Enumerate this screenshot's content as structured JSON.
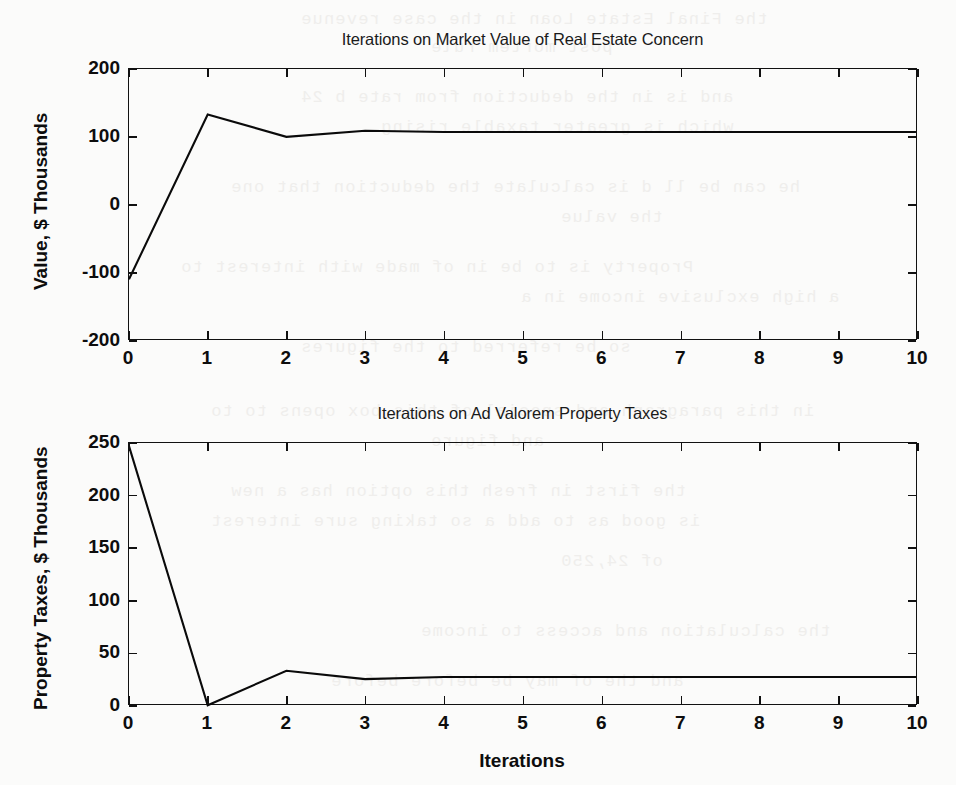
{
  "page": {
    "background_color": "#fbfbfa",
    "ink_color": "#0d0d0d",
    "ghost_text": [
      "the Final Estate Loan in the case revenue",
      "post mortem rule",
      "and is in the deduction from rate b 24",
      "which is greater taxable rising",
      "he  can  be  ll d is  calculate  the  deduction  that one",
      "the value",
      "Property is to be in of made with interest to",
      "a high  exclusive  income  in  a",
      "so be referred to the figures",
      "in this paragraph and special of this box opens to to",
      "and figure",
      "the first in fresh this option has a new",
      "is good as to add a so taking sure interest",
      "of 24,250",
      "the calculation and access to income",
      "and the  of  may  be  before  before"
    ]
  },
  "chart_data": [
    {
      "type": "line",
      "id": "market-value",
      "title": "Iterations on Market Value of Real Estate Concern",
      "xlabel": "",
      "ylabel": "Value, $ Thousands",
      "xlim": [
        0,
        10
      ],
      "ylim": [
        -200,
        200
      ],
      "xticks": [
        0,
        1,
        2,
        3,
        4,
        5,
        6,
        7,
        8,
        9,
        10
      ],
      "xticklabels": [
        "0",
        "1",
        "2",
        "3",
        "4",
        "5",
        "6",
        "7",
        "8",
        "9",
        "10"
      ],
      "yticks": [
        -200,
        -100,
        0,
        100,
        200
      ],
      "yticklabels": [
        "-200",
        "-100",
        "0",
        "100",
        "200"
      ],
      "grid": false,
      "legend": null,
      "series": [
        {
          "name": "Market Value of Real Estate Concern",
          "x": [
            0,
            1,
            2,
            3,
            4,
            5,
            6,
            7,
            8,
            9,
            10
          ],
          "values": [
            -110,
            133,
            100,
            109,
            107,
            107,
            107,
            107,
            107,
            107,
            107
          ]
        }
      ]
    },
    {
      "type": "line",
      "id": "property-taxes",
      "title": "Iterations on Ad Valorem Property Taxes",
      "xlabel": "Iterations",
      "ylabel": "Property Taxes, $ Thousands",
      "xlim": [
        0,
        10
      ],
      "ylim": [
        0,
        250
      ],
      "xticks": [
        0,
        1,
        2,
        3,
        4,
        5,
        6,
        7,
        8,
        9,
        10
      ],
      "xticklabels": [
        "0",
        "1",
        "2",
        "3",
        "4",
        "5",
        "6",
        "7",
        "8",
        "9",
        "10"
      ],
      "yticks": [
        0,
        50,
        100,
        150,
        200,
        250
      ],
      "yticklabels": [
        "0",
        "50",
        "100",
        "150",
        "200",
        "250"
      ],
      "grid": false,
      "legend": null,
      "series": [
        {
          "name": "Ad Valorem Property Taxes",
          "x": [
            0,
            1,
            2,
            3,
            4,
            5,
            6,
            7,
            8,
            9,
            10
          ],
          "values": [
            247,
            0,
            33,
            25,
            27,
            27,
            27,
            27,
            27,
            27,
            27
          ]
        }
      ]
    }
  ]
}
